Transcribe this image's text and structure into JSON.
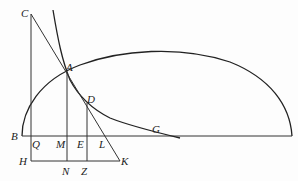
{
  "figure": {
    "type": "geometric-diagram",
    "labels": {
      "C": "C",
      "A": "A",
      "D": "D",
      "G": "G",
      "B": "B",
      "Q": "Q",
      "M": "M",
      "E": "E",
      "L": "L",
      "H": "H",
      "N": "N",
      "Z": "Z",
      "K": "K"
    },
    "colors": {
      "line": "#333333",
      "curve": "#222222",
      "background": "#fdfdfd"
    }
  }
}
